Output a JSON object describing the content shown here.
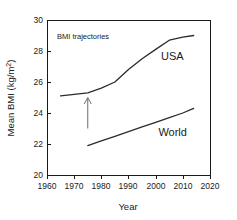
{
  "chart_data": {
    "type": "line",
    "title": "",
    "annotation_text": "BMI trajectories",
    "xlabel": "Year",
    "ylabel": "Mean BMI  (kg/m",
    "ylabel_sup": "2",
    "ylabel_tail": ")",
    "xlim": [
      1960,
      2020
    ],
    "ylim": [
      20,
      30
    ],
    "xticks": [
      1960,
      1970,
      1980,
      1990,
      2000,
      2010,
      2020
    ],
    "yticks": [
      20,
      22,
      24,
      26,
      28,
      30
    ],
    "xtick_labels": [
      "1960",
      "1970",
      "1980",
      "1990",
      "2000",
      "2010",
      "2020"
    ],
    "ytick_labels": [
      "20",
      "22",
      "24",
      "26",
      "28",
      "30"
    ],
    "grid": false,
    "legend_position": "inline-labels",
    "series": [
      {
        "name": "USA",
        "label": "USA",
        "label_x": 2002,
        "label_y": 27.4,
        "color": "#2b2b2b",
        "x": [
          1965,
          1970,
          1975,
          1980,
          1985,
          1990,
          1995,
          2000,
          2005,
          2010,
          2014
        ],
        "values": [
          25.1,
          25.2,
          25.3,
          25.6,
          26.0,
          26.8,
          27.5,
          28.1,
          28.7,
          28.9,
          29.0
        ]
      },
      {
        "name": "World",
        "label": "World",
        "label_x": 2001,
        "label_y": 22.5,
        "color": "#2b2b2b",
        "x": [
          1975,
          1980,
          1985,
          1990,
          1995,
          2000,
          2005,
          2010,
          2014
        ],
        "values": [
          21.9,
          22.2,
          22.5,
          22.8,
          23.1,
          23.4,
          23.7,
          24.0,
          24.3
        ]
      }
    ],
    "annotations": [
      {
        "name": "arrow-1975",
        "type": "arrow-up",
        "x": 1975,
        "y_from": 23.0,
        "y_to": 25.0,
        "color": "#6b6b6b"
      }
    ]
  }
}
